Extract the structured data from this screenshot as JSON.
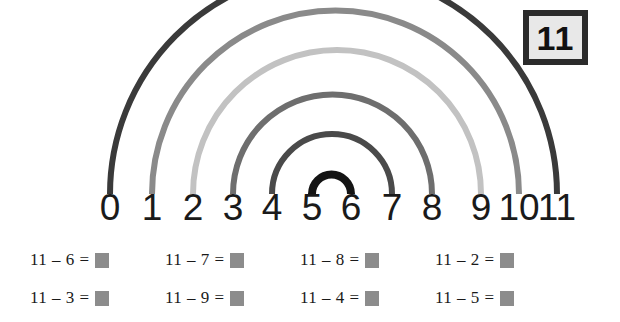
{
  "badge": {
    "value": "11",
    "border_color": "#2b2b2b",
    "fill_color": "#e8e8e8"
  },
  "number_line": {
    "labels": [
      "0",
      "1",
      "2",
      "3",
      "4",
      "5",
      "6",
      "7",
      "8",
      "9",
      "10",
      "11"
    ],
    "positions_px": [
      110,
      152,
      193,
      233,
      272,
      312,
      351,
      392,
      432,
      481,
      519,
      557
    ]
  },
  "arcs": [
    {
      "name": "arc-0-11",
      "from": 0,
      "to": 11,
      "color": "#3a3a3a",
      "width": 6
    },
    {
      "name": "arc-1-10",
      "from": 1,
      "to": 10,
      "color": "#8a8a8a",
      "width": 6
    },
    {
      "name": "arc-2-9",
      "from": 2,
      "to": 9,
      "color": "#c2c2c2",
      "width": 6
    },
    {
      "name": "arc-3-8",
      "from": 3,
      "to": 8,
      "color": "#6e6e6e",
      "width": 6
    },
    {
      "name": "arc-4-7",
      "from": 4,
      "to": 7,
      "color": "#4a4a4a",
      "width": 6
    },
    {
      "name": "arc-5-6",
      "from": 5,
      "to": 6,
      "color": "#141414",
      "width": 8
    }
  ],
  "equations": {
    "rows": [
      [
        {
          "text": "11 – 6 =",
          "minuend": "11",
          "subtrahend": "6"
        },
        {
          "text": "11 – 7 =",
          "minuend": "11",
          "subtrahend": "7"
        },
        {
          "text": "11 – 8 =",
          "minuend": "11",
          "subtrahend": "8"
        },
        {
          "text": "11 – 2 =",
          "minuend": "11",
          "subtrahend": "2"
        }
      ],
      [
        {
          "text": "11 – 3 =",
          "minuend": "11",
          "subtrahend": "3"
        },
        {
          "text": "11 – 9 =",
          "minuend": "11",
          "subtrahend": "9"
        },
        {
          "text": "11 – 4 =",
          "minuend": "11",
          "subtrahend": "4"
        },
        {
          "text": "11 – 5 =",
          "minuend": "11",
          "subtrahend": "5"
        }
      ]
    ],
    "column_positions_px": [
      30,
      165,
      300,
      435
    ],
    "answer_box_color": "#8c8c8c"
  }
}
